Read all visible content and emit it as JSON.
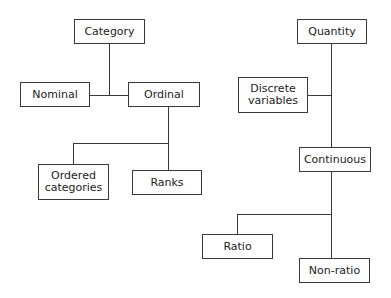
{
  "diagram": {
    "type": "tree",
    "colors": {
      "line": "#3a3a3a",
      "box_border": "#3a3a3a",
      "text": "#222222",
      "background": "#ffffff"
    },
    "left_tree": {
      "root": {
        "label": "Category"
      },
      "children": [
        {
          "label": "Nominal"
        },
        {
          "label": "Ordinal",
          "children": [
            {
              "label_line1": "Ordered",
              "label_line2": "categories"
            },
            {
              "label": "Ranks"
            }
          ]
        }
      ]
    },
    "right_tree": {
      "root": {
        "label": "Quantity"
      },
      "children": [
        {
          "label_line1": "Discrete",
          "label_line2": "variables"
        },
        {
          "label": "Continuous",
          "children": [
            {
              "label": "Ratio"
            },
            {
              "label": "Non-ratio"
            }
          ]
        }
      ]
    }
  }
}
